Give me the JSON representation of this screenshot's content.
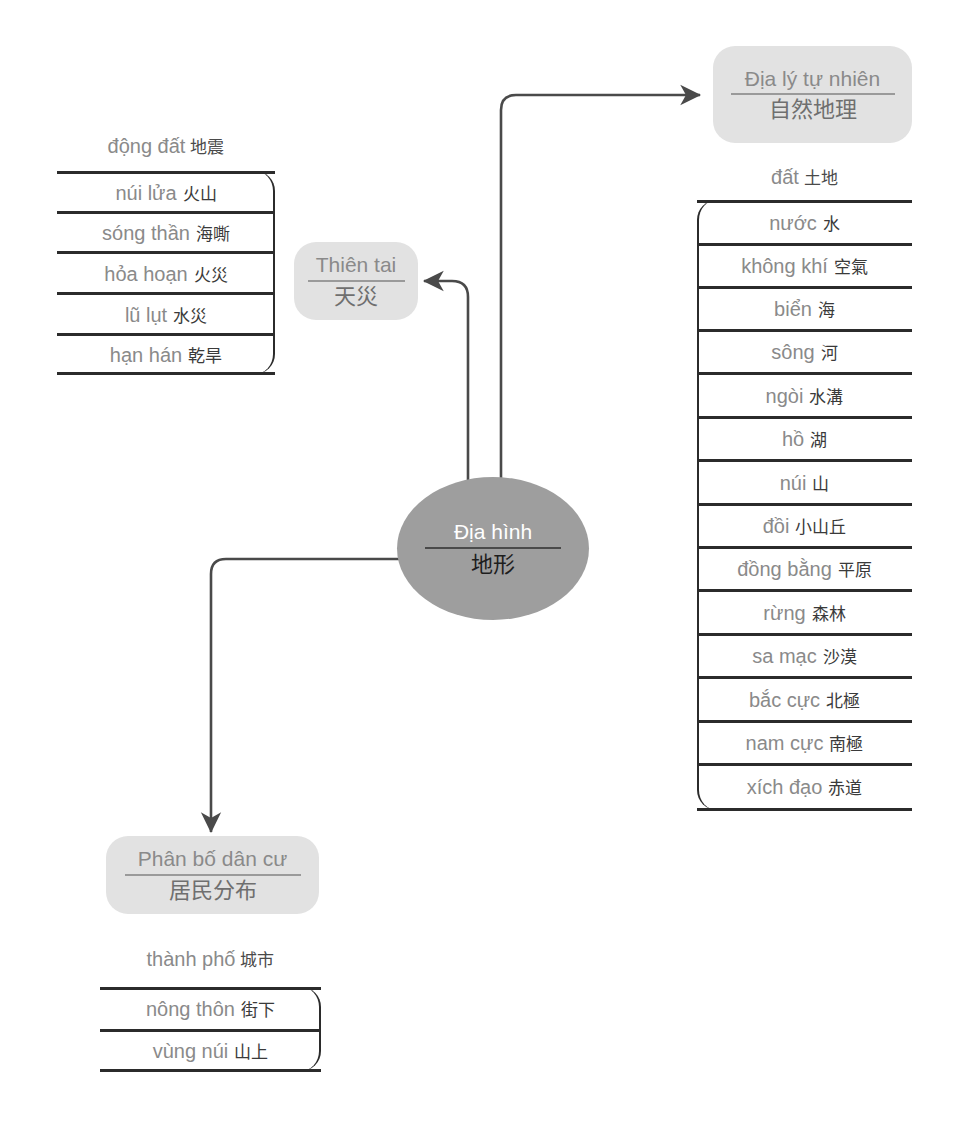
{
  "diagram": {
    "colors": {
      "node_fill": "#e2e2e2",
      "center_fill": "#9e9e9e",
      "stroke": "#2b2b2b",
      "vi_text": "#8a8a8a",
      "zh_text": "#3a3a3a",
      "center_vi_text": "#ffffff",
      "center_zh_text": "#1e1e1e"
    }
  },
  "center": {
    "vi": "Địa hình",
    "zh": "地形"
  },
  "nodes": {
    "nature": {
      "vi": "Địa lý tự nhiên",
      "zh": "自然地理"
    },
    "disaster": {
      "vi": "Thiên tai",
      "zh": "天災"
    },
    "population": {
      "vi": "Phân bố dân cư",
      "zh": "居民分布"
    }
  },
  "lists": {
    "disaster": {
      "head": {
        "vi": "động đất",
        "zh": "地震"
      },
      "rows": [
        {
          "vi": "núi lửa",
          "zh": "火山"
        },
        {
          "vi": "sóng thần",
          "zh": "海嘶"
        },
        {
          "vi": "hỏa hoạn",
          "zh": "火災"
        },
        {
          "vi": "lũ lụt",
          "zh": "水災"
        },
        {
          "vi": "hạn hán",
          "zh": "乾旱"
        }
      ]
    },
    "nature": {
      "head": {
        "vi": "đất",
        "zh": "土地"
      },
      "rows": [
        {
          "vi": "nước",
          "zh": "水"
        },
        {
          "vi": "không khí",
          "zh": "空氣"
        },
        {
          "vi": "biển",
          "zh": "海"
        },
        {
          "vi": "sông",
          "zh": "河"
        },
        {
          "vi": "ngòi",
          "zh": "水溝"
        },
        {
          "vi": "hồ",
          "zh": "湖"
        },
        {
          "vi": "núi",
          "zh": "山"
        },
        {
          "vi": "đồi",
          "zh": "小山丘"
        },
        {
          "vi": "đồng bằng",
          "zh": "平原"
        },
        {
          "vi": "rừng",
          "zh": "森林"
        },
        {
          "vi": "sa mạc",
          "zh": "沙漠"
        },
        {
          "vi": "bắc cực",
          "zh": "北極"
        },
        {
          "vi": "nam cực",
          "zh": "南極"
        },
        {
          "vi": "xích đạo",
          "zh": "赤道"
        }
      ]
    },
    "population": {
      "head": {
        "vi": "thành phố",
        "zh": "城市"
      },
      "rows": [
        {
          "vi": "nông thôn",
          "zh": "街下"
        },
        {
          "vi": "vùng núi",
          "zh": "山上"
        }
      ]
    }
  }
}
